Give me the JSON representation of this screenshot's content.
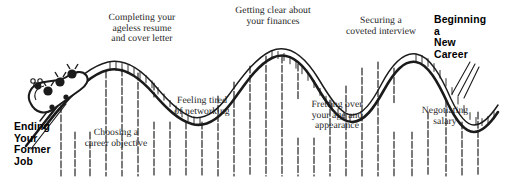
{
  "illustration": {
    "subject": "career-change roller coaster",
    "ink_color": "#1b1b1b",
    "paper_color": "#ffffff"
  },
  "start_label": {
    "text": "Ending\nYour\nFormer\nJob",
    "style": "bold-sans"
  },
  "end_label": {
    "text": "Beginning\na\nNew\nCareer",
    "style": "bold-sans"
  },
  "captions": [
    {
      "id": "career-objective",
      "text": "Choosing a\ncareer objective"
    },
    {
      "id": "ageless-resume",
      "text": "Completing your\nageless resume\nand cover letter"
    },
    {
      "id": "networking",
      "text": "Feeling tired\nof networking"
    },
    {
      "id": "finances",
      "text": "Getting clear about\nyour finances"
    },
    {
      "id": "age-appearance",
      "text": "Fretting over\nyour age and\nappearance"
    },
    {
      "id": "coveted-interview",
      "text": "Securing a\ncoveted interview"
    },
    {
      "id": "negotiating-salary",
      "text": "Negotiating\nsalary"
    }
  ],
  "coaster": {
    "car_riders": 3,
    "peaks": 3,
    "valleys": 3,
    "support_post_count": 26
  }
}
